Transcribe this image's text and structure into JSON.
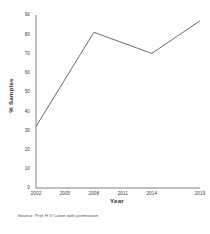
{
  "chart_data": {
    "type": "line",
    "title": "",
    "subtitle": "",
    "xlabel": "Year",
    "ylabel": "% Samples",
    "x": [
      2002,
      2008,
      2014,
      2019
    ],
    "values": [
      32,
      81,
      70,
      87
    ],
    "series": [
      {
        "name": "% Samples",
        "x": [
          2002,
          2008,
          2014,
          2019
        ],
        "values": [
          32,
          81,
          70,
          87
        ]
      }
    ],
    "xlim": [
      2002,
      2019
    ],
    "ylim": [
      0,
      90
    ],
    "x_tick_labels": [
      "2002",
      "2005",
      "2008",
      "2011",
      "2014",
      "2019"
    ],
    "x_tick_values": [
      2002,
      2005,
      2008,
      2011,
      2014,
      2019
    ],
    "y_tick_labels": [
      "0",
      "10",
      "20",
      "30",
      "40",
      "50",
      "60",
      "70",
      "80",
      "90"
    ],
    "y_tick_values": [
      0,
      10,
      20,
      30,
      40,
      50,
      60,
      70,
      80,
      90
    ],
    "grid": false,
    "legend": false,
    "legend_position": "none",
    "line_color": "#595959",
    "axis_color": "#808080",
    "markers": false,
    "annotations": []
  },
  "source": {
    "text": "Source: Prof H V Caton with permission"
  }
}
